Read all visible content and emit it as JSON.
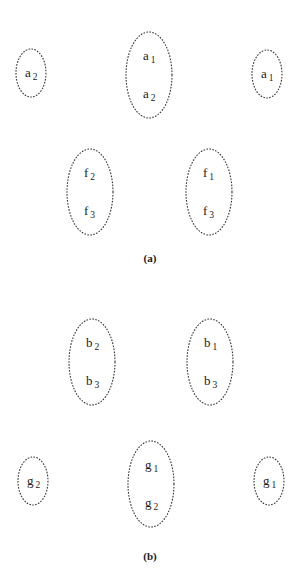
{
  "panels": [
    {
      "caption": "(a)",
      "caption_pos": [
        150,
        262
      ],
      "groups": [
        {
          "id": "a-left",
          "cx": 31,
          "cy": 73,
          "rx": 15,
          "ry": 24,
          "items": [
            {
              "base": "a",
              "sub": "2"
            }
          ]
        },
        {
          "id": "a-center",
          "cx": 149,
          "cy": 75,
          "rx": 23,
          "ry": 43,
          "items": [
            {
              "base": "a",
              "sub": "1"
            },
            {
              "base": "a",
              "sub": "2"
            }
          ]
        },
        {
          "id": "a-right",
          "cx": 267,
          "cy": 74,
          "rx": 15,
          "ry": 24,
          "items": [
            {
              "base": "a",
              "sub": "1"
            }
          ]
        },
        {
          "id": "f-left",
          "cx": 90,
          "cy": 192,
          "rx": 23,
          "ry": 43,
          "items": [
            {
              "base": "f",
              "sub": "2"
            },
            {
              "base": "f",
              "sub": "3"
            }
          ]
        },
        {
          "id": "f-right",
          "cx": 209,
          "cy": 192,
          "rx": 23,
          "ry": 43,
          "items": [
            {
              "base": "f",
              "sub": "1"
            },
            {
              "base": "f",
              "sub": "3"
            }
          ]
        }
      ]
    },
    {
      "caption": "(b)",
      "caption_pos": [
        150,
        560
      ],
      "groups": [
        {
          "id": "b-left",
          "cx": 92,
          "cy": 362,
          "rx": 23,
          "ry": 43,
          "items": [
            {
              "base": "b",
              "sub": "2"
            },
            {
              "base": "b",
              "sub": "3"
            }
          ]
        },
        {
          "id": "b-right",
          "cx": 210,
          "cy": 362,
          "rx": 23,
          "ry": 43,
          "items": [
            {
              "base": "b",
              "sub": "1"
            },
            {
              "base": "b",
              "sub": "3"
            }
          ]
        },
        {
          "id": "g-left",
          "cx": 33,
          "cy": 481,
          "rx": 15,
          "ry": 24,
          "items": [
            {
              "base": "g",
              "sub": "2"
            }
          ]
        },
        {
          "id": "g-center",
          "cx": 151,
          "cy": 484,
          "rx": 23,
          "ry": 43,
          "items": [
            {
              "base": "g",
              "sub": "1"
            },
            {
              "base": "g",
              "sub": "2"
            }
          ]
        },
        {
          "id": "g-right",
          "cx": 269,
          "cy": 481,
          "rx": 15,
          "ry": 24,
          "items": [
            {
              "base": "g",
              "sub": "1"
            }
          ]
        }
      ]
    }
  ]
}
